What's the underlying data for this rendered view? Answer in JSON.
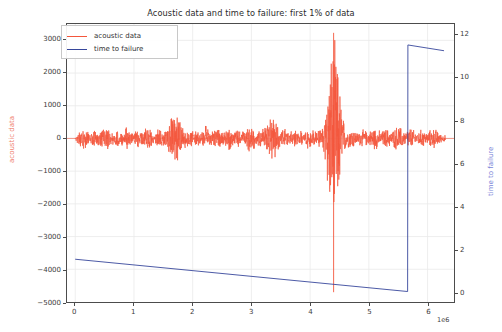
{
  "chart_data": {
    "type": "line",
    "title": "Acoustic data and time to failure: first 1% of data",
    "xlabel": "",
    "ylabel": "acoustic data",
    "ylabel_right": "time to failure",
    "x_exponent": "1e6",
    "grid": true,
    "legend_position": "upper left",
    "xlim": [
      -140000,
      6450000
    ],
    "xticks": [
      0,
      1,
      2,
      3,
      4,
      5,
      6
    ],
    "xtick_labels": [
      "0",
      "1",
      "2",
      "3",
      "4",
      "5",
      "6"
    ],
    "ylim_left": [
      -5000,
      3500
    ],
    "yticks_left": [
      3000,
      2000,
      1000,
      0,
      -1000,
      -2000,
      -3000,
      -4000,
      -5000
    ],
    "ytick_labels_left": [
      "3000",
      "2000",
      "1000",
      "0",
      "−1000",
      "−2000",
      "−3000",
      "−4000",
      "−5000"
    ],
    "ylim_right": [
      -0.47,
      12.53
    ],
    "yticks_right": [
      0,
      2,
      4,
      6,
      8,
      10,
      12
    ],
    "ytick_labels_right": [
      "0",
      "2",
      "4",
      "6",
      "8",
      "10",
      "12"
    ],
    "series": [
      {
        "name": "acoustic data",
        "color": "#f4563c",
        "axis": "left",
        "description": "dense noise band centered at 0 with amplitude mostly under 300, many local bursts, and one very large spike near x=4.4e6 reaching +3200 and -4700",
        "baseline": 0,
        "noise_band": 120,
        "burst_events": [
          {
            "x": 150000,
            "amplitude": 330
          },
          {
            "x": 330000,
            "amplitude": 280
          },
          {
            "x": 520000,
            "amplitude": 400
          },
          {
            "x": 700000,
            "amplitude": 260
          },
          {
            "x": 880000,
            "amplitude": 350
          },
          {
            "x": 1060000,
            "amplitude": 300
          },
          {
            "x": 1240000,
            "amplitude": 420
          },
          {
            "x": 1420000,
            "amplitude": 290
          },
          {
            "x": 1620000,
            "amplitude": 520
          },
          {
            "x": 1700000,
            "amplitude": 900
          },
          {
            "x": 1860000,
            "amplitude": 360
          },
          {
            "x": 2040000,
            "amplitude": 300
          },
          {
            "x": 2230000,
            "amplitude": 430
          },
          {
            "x": 2420000,
            "amplitude": 330
          },
          {
            "x": 2600000,
            "amplitude": 380
          },
          {
            "x": 2790000,
            "amplitude": 300
          },
          {
            "x": 2980000,
            "amplitude": 450
          },
          {
            "x": 3160000,
            "amplitude": 320
          },
          {
            "x": 3350000,
            "amplitude": 800
          },
          {
            "x": 3540000,
            "amplitude": 340
          },
          {
            "x": 3730000,
            "amplitude": 300
          },
          {
            "x": 3920000,
            "amplitude": 390
          },
          {
            "x": 4110000,
            "amplitude": 330
          },
          {
            "x": 4300000,
            "amplitude": 600
          },
          {
            "x": 4400000,
            "amplitude": 3200
          },
          {
            "x": 4500000,
            "amplitude": 700
          },
          {
            "x": 4700000,
            "amplitude": 350
          },
          {
            "x": 4900000,
            "amplitude": 300
          },
          {
            "x": 5100000,
            "amplitude": 380
          },
          {
            "x": 5300000,
            "amplitude": 330
          },
          {
            "x": 5500000,
            "amplitude": 420
          },
          {
            "x": 5700000,
            "amplitude": 360
          },
          {
            "x": 5900000,
            "amplitude": 300
          },
          {
            "x": 6100000,
            "amplitude": 340
          }
        ],
        "major_spike": {
          "x": 4400000,
          "y_max": 3230,
          "y_min": -4700
        }
      },
      {
        "name": "time to failure",
        "color": "#36469b",
        "axis": "right",
        "description": "sawtooth: decays linearly from 1.53 at x=0 down to 0.0 at x=5.66e6, then resets to 11.55 and decays slowly to 11.28 at x=6.28e6",
        "points": [
          {
            "x": 0,
            "y": 1.53
          },
          {
            "x": 5660000,
            "y": 0.02
          },
          {
            "x": 5665000,
            "y": 11.55
          },
          {
            "x": 6280000,
            "y": 11.28
          }
        ]
      }
    ]
  },
  "legend": {
    "items": [
      {
        "label": "acoustic data",
        "color": "#f4563c"
      },
      {
        "label": "time to failure",
        "color": "#36469b"
      }
    ]
  },
  "colors": {
    "acoustic": "#f4563c",
    "time_to_failure": "#36469b",
    "acoustic_axis_label": "#f08070",
    "ttf_axis_label": "#7b85d8",
    "grid": "#e9e9e9",
    "frame": "#4c4c4c",
    "text": "#3c3c3c"
  }
}
